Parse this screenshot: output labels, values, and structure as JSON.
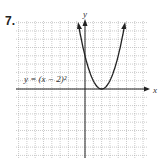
{
  "problem_number": "7.",
  "chart_data": {
    "type": "line",
    "title": "",
    "equation_label": "y = (x − 2)²",
    "xlabel": "x",
    "ylabel": "y",
    "xlim": [
      -8,
      8
    ],
    "ylim": [
      -8,
      8
    ],
    "grid": true,
    "series": [
      {
        "name": "y = (x − 2)²",
        "vertex": [
          2,
          0
        ],
        "x": [
          -1,
          0,
          1,
          2,
          3,
          4,
          5
        ],
        "values": [
          9,
          4,
          1,
          0,
          1,
          4,
          9
        ]
      }
    ]
  }
}
